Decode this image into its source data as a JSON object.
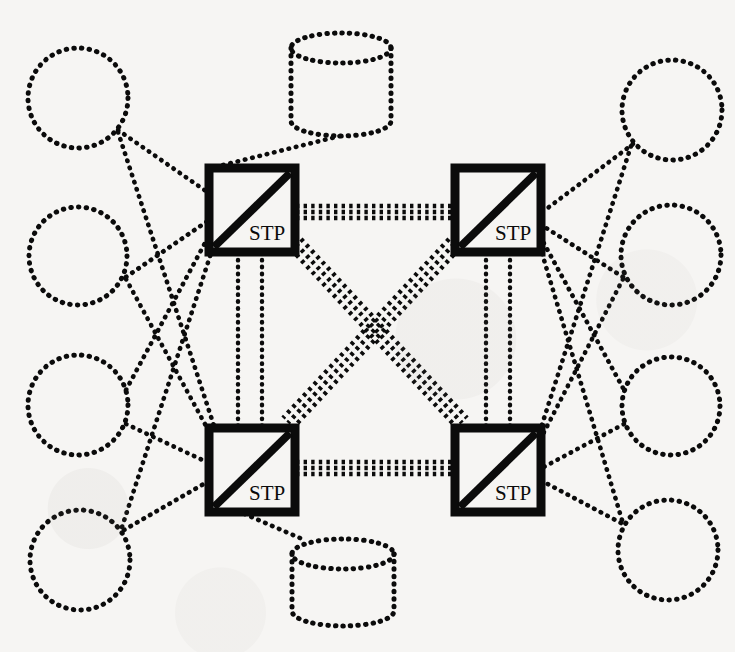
{
  "diagram": {
    "background_color": "#f6f5f3",
    "stroke_color": "#0b0b0b",
    "node_label": "STP",
    "nodes": [
      {
        "id": "stp-top-left",
        "label": "STP",
        "x": 209,
        "y": 168,
        "w": 86,
        "h": 84
      },
      {
        "id": "stp-top-right",
        "label": "STP",
        "x": 455,
        "y": 168,
        "w": 86,
        "h": 84
      },
      {
        "id": "stp-bottom-left",
        "label": "STP",
        "x": 209,
        "y": 428,
        "w": 86,
        "h": 84
      },
      {
        "id": "stp-bottom-right",
        "label": "STP",
        "x": 455,
        "y": 428,
        "w": 86,
        "h": 84
      }
    ],
    "circles": [
      {
        "id": "circle-left-1",
        "cx": 78,
        "cy": 98,
        "r": 50
      },
      {
        "id": "circle-left-2",
        "cx": 78,
        "cy": 256,
        "r": 49
      },
      {
        "id": "circle-left-3",
        "cx": 78,
        "cy": 405,
        "r": 50
      },
      {
        "id": "circle-left-4",
        "cx": 80,
        "cy": 560,
        "r": 50
      },
      {
        "id": "circle-right-1",
        "cx": 672,
        "cy": 110,
        "r": 50
      },
      {
        "id": "circle-right-2",
        "cx": 671,
        "cy": 255,
        "r": 50
      },
      {
        "id": "circle-right-3",
        "cx": 671,
        "cy": 406,
        "r": 49
      },
      {
        "id": "circle-right-4",
        "cx": 668,
        "cy": 550,
        "r": 50
      }
    ],
    "databases": [
      {
        "id": "database-top",
        "cx": 341,
        "cy": 85,
        "rx": 50,
        "ry": 15,
        "height": 73
      },
      {
        "id": "database-bottom",
        "cx": 343,
        "cy": 568,
        "rx": 51,
        "ry": 15,
        "height": 72
      }
    ],
    "links": {
      "trunk_triple": [
        {
          "id": "link-top-horizontal",
          "from": "stp-top-left",
          "to": "stp-top-right",
          "lines": 3
        },
        {
          "id": "link-bottom-horizontal",
          "from": "stp-bottom-left",
          "to": "stp-bottom-right",
          "lines": 3
        },
        {
          "id": "link-diagonal-a",
          "from": "stp-top-left",
          "to": "stp-bottom-right",
          "lines": 3
        },
        {
          "id": "link-diagonal-b",
          "from": "stp-top-right",
          "to": "stp-bottom-left",
          "lines": 3
        }
      ],
      "trunk_double": [
        {
          "id": "link-left-vertical",
          "from": "stp-top-left",
          "to": "stp-bottom-left",
          "lines": 2
        },
        {
          "id": "link-right-vertical",
          "from": "stp-top-right",
          "to": "stp-bottom-right",
          "lines": 2
        }
      ],
      "access_single_count": 16,
      "database_links_count": 2
    }
  }
}
